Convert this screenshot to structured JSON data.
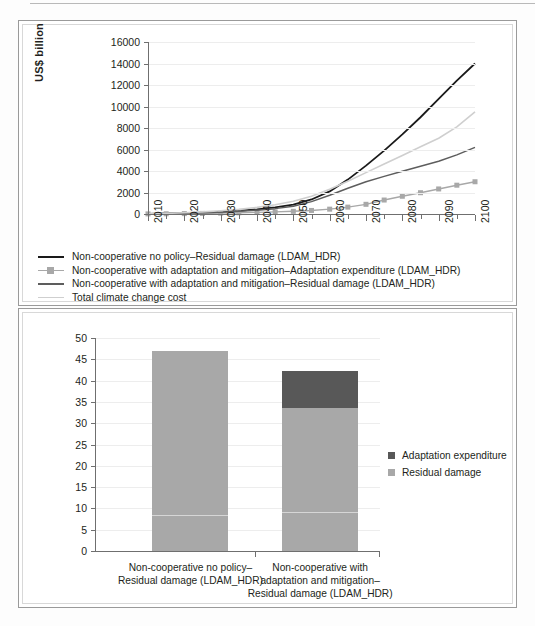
{
  "chart_data": [
    {
      "type": "line",
      "panel": "top",
      "title": "",
      "xlabel": "",
      "ylabel": "US$ billion",
      "ylim": [
        0,
        16000
      ],
      "ytick_values": [
        0,
        2000,
        4000,
        6000,
        8000,
        10000,
        12000,
        14000,
        16000
      ],
      "ytick_labels": [
        "0",
        "2000",
        "4000",
        "6000",
        "8000",
        "10000",
        "12000",
        "14000",
        "16000"
      ],
      "xlim": [
        2010,
        2100
      ],
      "x": [
        2010,
        2015,
        2020,
        2025,
        2030,
        2035,
        2040,
        2045,
        2050,
        2055,
        2060,
        2065,
        2070,
        2075,
        2080,
        2085,
        2090,
        2095,
        2100
      ],
      "xtick_labels": [
        "2010",
        "2020",
        "2030",
        "2040",
        "2050",
        "2060",
        "2070",
        "2080",
        "2090",
        "2100"
      ],
      "xtick_step_years": 10,
      "minor_tick_step_years": 5,
      "grid": true,
      "legend_position": "below",
      "series": [
        {
          "name": "Non-cooperative no policy–Residual damage  (LDAM_HDR)",
          "color": "#1a1a1a",
          "marker": "none",
          "width": 1.8,
          "values": [
            20,
            45,
            80,
            130,
            200,
            300,
            430,
            610,
            870,
            1350,
            2100,
            3200,
            4500,
            5900,
            7400,
            9000,
            10700,
            12400,
            14000
          ]
        },
        {
          "name": "Non-cooperative with adaptation and mitigation–Adaptation expenditure (LDAM_HDR)",
          "color": "#a8a8a8",
          "marker": "square",
          "width": 1.4,
          "values": [
            10,
            20,
            35,
            55,
            80,
            110,
            150,
            195,
            250,
            330,
            450,
            640,
            900,
            1300,
            1650,
            1980,
            2330,
            2680,
            3000,
            3350
          ]
        },
        {
          "name": "Non-cooperative with adaptation and mitigation–Residual damage (LDAM_HDR)",
          "color": "#5d5d5d",
          "marker": "none",
          "width": 1.5,
          "values": [
            15,
            35,
            65,
            105,
            165,
            245,
            355,
            500,
            730,
            1150,
            1750,
            2400,
            3000,
            3500,
            3980,
            4450,
            4900,
            5500,
            6200
          ]
        },
        {
          "name": "Total climate change cost",
          "color": "#cfcfcf",
          "marker": "none",
          "width": 1.6,
          "values": [
            25,
            60,
            115,
            195,
            300,
            440,
            620,
            860,
            1180,
            1650,
            2300,
            3050,
            3850,
            4650,
            5450,
            6250,
            7050,
            8100,
            9500
          ]
        }
      ]
    },
    {
      "type": "bar",
      "panel": "bottom",
      "stacked": true,
      "title": "",
      "xlabel": "",
      "ylabel": "",
      "ylim": [
        0,
        50
      ],
      "ytick_values": [
        0,
        5,
        10,
        15,
        20,
        25,
        30,
        35,
        40,
        45,
        50
      ],
      "ytick_labels": [
        "0",
        "5",
        "10",
        "15",
        "20",
        "25",
        "30",
        "35",
        "40",
        "45",
        "50"
      ],
      "grid": true,
      "legend_position": "right",
      "categories": [
        "Non-cooperative no policy–\nResidual damage (LDAM_HDR)",
        "Non-cooperative with\nadaptation and mitigation–\nResidual damage (LDAM_HDR)"
      ],
      "series": [
        {
          "name": "Residual damage",
          "color": "#a8a8a8",
          "values": [
            47.0,
            33.5
          ]
        },
        {
          "name": "Adaptation expenditure",
          "color": "#585858",
          "values": [
            0.0,
            8.8
          ]
        }
      ],
      "totals": [
        47.0,
        42.3
      ],
      "hairline_marks": [
        8.2,
        8.9
      ]
    }
  ],
  "top_chart": {
    "y_axis_title": "US$ billion",
    "y_ticks": [
      "16000",
      "14000",
      "12000",
      "10000",
      "8000",
      "6000",
      "4000",
      "2000",
      "0"
    ],
    "x_ticks": [
      "2010",
      "2020",
      "2030",
      "2040",
      "2050",
      "2060",
      "2070",
      "2080",
      "2090",
      "2100"
    ],
    "legend": [
      {
        "label": "Non-cooperative no policy–Residual damage  (LDAM_HDR)",
        "color": "#1a1a1a",
        "style": "line"
      },
      {
        "label": "Non-cooperative with adaptation and mitigation–Adaptation expenditure (LDAM_HDR)",
        "color": "#a8a8a8",
        "style": "marker"
      },
      {
        "label": "Non-cooperative with adaptation and mitigation–Residual damage (LDAM_HDR)",
        "color": "#5d5d5d",
        "style": "line"
      },
      {
        "label": "Total climate change cost",
        "color": "#cfcfcf",
        "style": "line-thin"
      }
    ]
  },
  "bottom_chart": {
    "y_ticks": [
      "50",
      "45",
      "40",
      "35",
      "30",
      "25",
      "20",
      "15",
      "10",
      "5",
      "0"
    ],
    "category_labels": [
      {
        "line1": "Non-cooperative no policy–",
        "line2": "Residual damage (LDAM_HDR)",
        "line3": ""
      },
      {
        "line1": "Non-cooperative with",
        "line2": "adaptation and mitigation–",
        "line3": "Residual damage (LDAM_HDR)"
      }
    ],
    "legend": [
      {
        "label": "Adaptation expenditure",
        "color": "#585858"
      },
      {
        "label": "Residual damage",
        "color": "#a8a8a8"
      }
    ]
  }
}
